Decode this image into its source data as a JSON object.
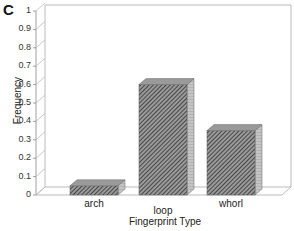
{
  "panel_label": "C",
  "chart_data": {
    "type": "bar",
    "style": "3d",
    "title": "",
    "xlabel": "Fingerprint Type",
    "ylabel": "Frequency",
    "categories": [
      "arch",
      "loop",
      "whorl"
    ],
    "values": [
      0.05,
      0.6,
      0.35
    ],
    "ylim": [
      0,
      1
    ],
    "yticks": [
      "0",
      "0.1",
      "0.2",
      "0.3",
      "0.4",
      "0.5",
      "0.6",
      "0.7",
      "0.8",
      "0.9",
      "1"
    ],
    "grid": false,
    "legend": null,
    "bar_fill": "diagonal-hatch",
    "colors": {
      "bar_front": "#6e6e6e",
      "bar_top": "#9a9a9a",
      "bar_side": "#b5b5b5",
      "axis": "#999999"
    }
  }
}
